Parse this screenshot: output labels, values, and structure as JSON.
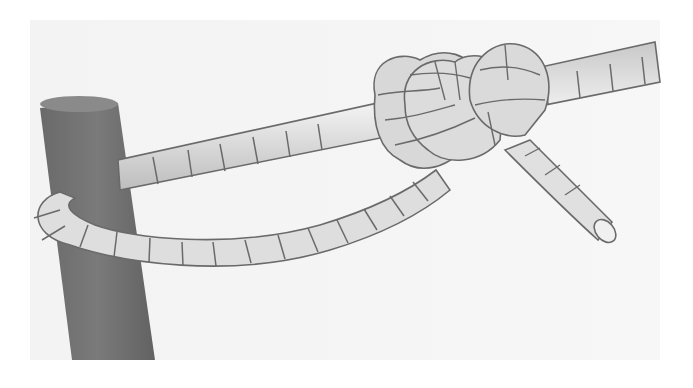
{
  "figure": {
    "colors": {
      "background": "#ffffff",
      "paper": "#f4f4f4",
      "post": "#707070",
      "rope_fill": "#dcdcdc",
      "rope_highlight": "#f2f2f2",
      "rope_outline": "#6a6a6a"
    }
  },
  "ghost_text": {
    "lines": [
      "",
      "",
      "",
      "",
      ""
    ]
  }
}
